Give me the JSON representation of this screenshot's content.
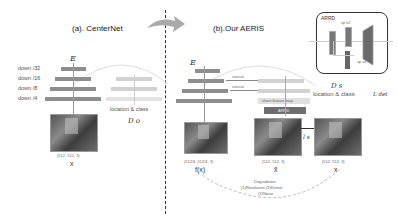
{
  "left": {
    "title": "(a). CenterNet",
    "encoder_label": "E",
    "levels": [
      "down /32",
      "down /16",
      "down /8",
      "down /4"
    ],
    "head_label": "location & class",
    "decoder_label": "D o",
    "image_dims": "(512, 512, 3)",
    "image_label": "x"
  },
  "right": {
    "title": "(b).Our AERIS",
    "encoder_label": "E",
    "concat_labels": [
      "concat",
      "concat"
    ],
    "share_label": "share feature map",
    "arrd_block_label": "ARRD",
    "arrd_box": {
      "title": "ARRD",
      "up_x2": "up x2",
      "up_x4": "up x4"
    },
    "decoder_label": "D s",
    "head_label": "location & class",
    "loss_det": "L det",
    "loss_sr": "l s",
    "images": [
      {
        "dims": "(512/4, 512/4, 3)",
        "label": "f(x)"
      },
      {
        "dims": "(512, 512, 3)",
        "label": "x̂"
      },
      {
        "dims": "(512, 512, 3)",
        "label": "x"
      }
    ],
    "degradation": {
      "title": "Degradation",
      "line1": "(1)Resolution (2)Kernel",
      "line2": "(3)Noise"
    }
  }
}
